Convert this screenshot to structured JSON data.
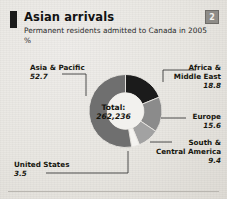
{
  "header": {
    "title": "Asian arrivals",
    "subtitle": "Permanent residents admitted to Canada in 2005",
    "unit": "%",
    "badge": "2"
  },
  "center": {
    "total_label": "Total:",
    "total_value": "262,236"
  },
  "colors": {
    "africa": "#1b1b1b",
    "europe": "#8b8b8b",
    "south": "#a2a2a2",
    "united_states": "#f4f3f0",
    "asia": "#6f6f6f",
    "hole": "#f2f1ee",
    "background": "#e9e7e2",
    "text": "#17170f",
    "leader": "#3a3a3a"
  },
  "chart_data": {
    "type": "pie",
    "variant": "donut",
    "title": "Asian arrivals",
    "subtitle": "Permanent residents admitted to Canada in 2005",
    "unit": "%",
    "total_label": "Total:",
    "total_value": 262236,
    "total_value_text": "262,236",
    "start_angle_deg": 0,
    "direction": "clockwise",
    "inner_radius_ratio": 0.5,
    "labels": [
      "Africa & Middle East",
      "Europe",
      "South & Central America",
      "United States",
      "Asia & Pacific"
    ],
    "values": [
      18.8,
      15.6,
      9.4,
      3.5,
      52.7
    ],
    "value_texts": [
      "18.8",
      "15.6",
      "9.4",
      "3.5",
      "52.7"
    ],
    "slice_colors": [
      "#1b1b1b",
      "#8b8b8b",
      "#a2a2a2",
      "#f4f3f0",
      "#6f6f6f"
    ],
    "legend": "callout-labels"
  },
  "labels": {
    "asia": {
      "name": "Asia & Pacific",
      "value": "52.7"
    },
    "africa": {
      "name_line1": "Africa &",
      "name_line2": "Middle East",
      "value": "18.8"
    },
    "europe": {
      "name": "Europe",
      "value": "15.6"
    },
    "south": {
      "name_line1": "South &",
      "name_line2": "Central America",
      "value": "9.4"
    },
    "united_states": {
      "name": "United States",
      "value": "3.5"
    }
  }
}
